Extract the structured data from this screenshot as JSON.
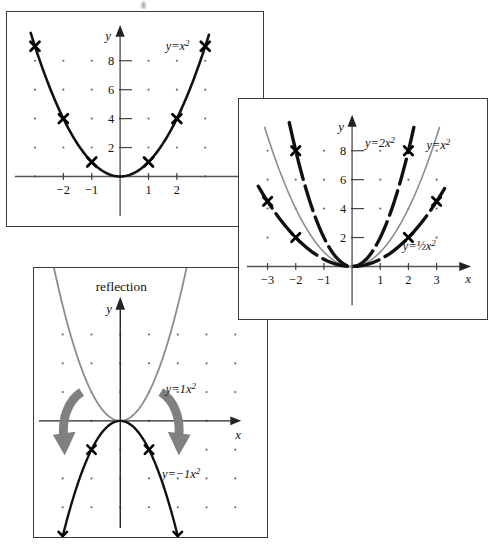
{
  "page": {
    "background_color": "#ffffff",
    "ink_color": "#111111",
    "gray_curve_color": "#8c8c8c",
    "arrow_color": "#808080",
    "grid_dot_color": "#6d6d6d",
    "panel_border_color": "#3a3a3a"
  },
  "panels": [
    {
      "id": "basic",
      "name": "basic-parabola-panel",
      "title": "",
      "axis": {
        "x_label": "x",
        "y_label": "y"
      },
      "x_ticks": [
        {
          "value": -2,
          "label": "−2"
        },
        {
          "value": -1,
          "label": "−1"
        },
        {
          "value": 1,
          "label": "1"
        },
        {
          "value": 2,
          "label": "2"
        }
      ],
      "y_ticks": [
        {
          "value": 2,
          "label": "2"
        },
        {
          "value": 4,
          "label": "4"
        },
        {
          "value": 6,
          "label": "6"
        },
        {
          "value": 8,
          "label": "8"
        }
      ],
      "curves": [
        {
          "name": "curve-y-equals-x-squared",
          "label": "y = x²",
          "label_text": "y=x",
          "label_exponent": "2",
          "coefficient": 1,
          "color": "#111111",
          "style": "solid-black",
          "width": 2.6,
          "marked_points": [
            {
              "x": -3,
              "y": 9
            },
            {
              "x": -2,
              "y": 4
            },
            {
              "x": -1,
              "y": 1
            },
            {
              "x": 1,
              "y": 1
            },
            {
              "x": 2,
              "y": 4
            },
            {
              "x": 3,
              "y": 9
            }
          ]
        }
      ]
    },
    {
      "id": "stretch",
      "name": "stretch-compression-panel",
      "title": "",
      "axis": {
        "x_label": "x",
        "y_label": "y"
      },
      "x_ticks": [
        {
          "value": -3,
          "label": "−3"
        },
        {
          "value": -2,
          "label": "−2"
        },
        {
          "value": -1,
          "label": "−1"
        },
        {
          "value": 1,
          "label": "1"
        },
        {
          "value": 2,
          "label": "2"
        },
        {
          "value": 3,
          "label": "3"
        }
      ],
      "y_ticks": [
        {
          "value": 2,
          "label": "2"
        },
        {
          "value": 4,
          "label": "4"
        },
        {
          "value": 6,
          "label": "6"
        },
        {
          "value": 8,
          "label": "8"
        }
      ],
      "curves": [
        {
          "name": "curve-y-equals-2x-squared",
          "label": "y = 2x²",
          "label_text": "y=2x",
          "label_exponent": "2",
          "coefficient": 2,
          "color": "#111111",
          "style": "dashed-black",
          "width": 3.4,
          "marked_points": [
            {
              "x": -2,
              "y": 8
            },
            {
              "x": 2,
              "y": 8
            }
          ]
        },
        {
          "name": "curve-y-equals-x-squared",
          "label": "y = x²",
          "label_text": "y=x",
          "label_exponent": "2",
          "coefficient": 1,
          "color": "#8c8c8c",
          "style": "solid-gray",
          "width": 1.6,
          "marked_points": []
        },
        {
          "name": "curve-y-equals-half-x-squared",
          "label": "y = ½x²",
          "label_text": "y=½x",
          "label_exponent": "2",
          "coefficient": 0.5,
          "color": "#111111",
          "style": "dashed-black",
          "width": 3.4,
          "marked_points": [
            {
              "x": -3,
              "y": 4.5
            },
            {
              "x": -2,
              "y": 2
            },
            {
              "x": 2,
              "y": 2
            },
            {
              "x": 3,
              "y": 4.5
            }
          ]
        }
      ]
    },
    {
      "id": "reflect",
      "name": "reflection-panel",
      "title": "reflection",
      "axis": {
        "x_label": "x",
        "y_label": "y"
      },
      "x_ticks": [],
      "y_ticks": [],
      "curves": [
        {
          "name": "curve-y-equals-1x-squared",
          "label": "y = 1x²",
          "label_text": "y=1x",
          "label_exponent": "2",
          "coefficient": 1,
          "color": "#8c8c8c",
          "style": "solid-gray",
          "width": 1.8,
          "marked_points": []
        },
        {
          "name": "curve-y-equals-minus-1x-squared",
          "label": "y = −1x²",
          "label_text": "y=−1x",
          "label_exponent": "2",
          "coefficient": -1,
          "color": "#111111",
          "style": "solid-black",
          "width": 2.4,
          "marked_points": [
            {
              "x": -2,
              "y": -4
            },
            {
              "x": -1,
              "y": -1
            },
            {
              "x": 1,
              "y": -1
            },
            {
              "x": 2,
              "y": -4
            }
          ]
        }
      ],
      "annotations": [
        {
          "name": "reflection-arrow-left",
          "kind": "curved-arrow",
          "direction": "down-left",
          "color": "#808080"
        },
        {
          "name": "reflection-arrow-right",
          "kind": "curved-arrow",
          "direction": "down-right",
          "color": "#808080"
        }
      ]
    }
  ],
  "chart_data": {
    "type": "line",
    "xlabel": "x",
    "ylabel": "y",
    "charts": [
      {
        "panel": "basic",
        "title": "",
        "xlim": [
          -3.4,
          3.4
        ],
        "ylim": [
          -1.5,
          9.8
        ],
        "xticks": [
          -2,
          -1,
          1,
          2
        ],
        "yticks": [
          2,
          4,
          6,
          8
        ],
        "grid": "dots",
        "series": [
          {
            "name": "y=x²",
            "equation": "y = x^2",
            "coefficient": 1,
            "color": "#111111",
            "x": [
              -3,
              -2,
              -1,
              0,
              1,
              2,
              3
            ],
            "values": [
              9,
              4,
              1,
              0,
              1,
              4,
              9
            ],
            "markers": [
              {
                "x": -3,
                "y": 9
              },
              {
                "x": -2,
                "y": 4
              },
              {
                "x": -1,
                "y": 1
              },
              {
                "x": 1,
                "y": 1
              },
              {
                "x": 2,
                "y": 4
              },
              {
                "x": 3,
                "y": 9
              }
            ]
          }
        ]
      },
      {
        "panel": "stretch",
        "title": "",
        "xlim": [
          -3.7,
          3.7
        ],
        "ylim": [
          -1.5,
          9.6
        ],
        "xticks": [
          -3,
          -2,
          -1,
          1,
          2,
          3
        ],
        "yticks": [
          2,
          4,
          6,
          8
        ],
        "grid": "dots",
        "series": [
          {
            "name": "y=2x²",
            "equation": "y = 2x^2",
            "coefficient": 2,
            "color": "#111111",
            "x": [
              -2.2,
              -2,
              -1,
              0,
              1,
              2,
              2.2
            ],
            "values": [
              9.68,
              8,
              2,
              0,
              2,
              8,
              9.68
            ],
            "markers": [
              {
                "x": -2,
                "y": 8
              },
              {
                "x": 2,
                "y": 8
              }
            ]
          },
          {
            "name": "y=x²",
            "equation": "y = x^2",
            "coefficient": 1,
            "color": "#8c8c8c",
            "x": [
              -3,
              -2,
              -1,
              0,
              1,
              2,
              3
            ],
            "values": [
              9,
              4,
              1,
              0,
              1,
              4,
              9
            ],
            "markers": []
          },
          {
            "name": "y=½x²",
            "equation": "y = 0.5x^2",
            "coefficient": 0.5,
            "color": "#111111",
            "x": [
              -3.3,
              -3,
              -2,
              -1,
              0,
              1,
              2,
              3,
              3.3
            ],
            "values": [
              5.45,
              4.5,
              2,
              0.5,
              0,
              0.5,
              2,
              4.5,
              5.45
            ],
            "markers": [
              {
                "x": -3,
                "y": 4.5
              },
              {
                "x": -2,
                "y": 2
              },
              {
                "x": 2,
                "y": 2
              },
              {
                "x": 3,
                "y": 4.5
              }
            ]
          }
        ]
      },
      {
        "panel": "reflect",
        "title": "reflection",
        "xlim": [
          -2.9,
          2.9
        ],
        "ylim": [
          -5.6,
          5.4
        ],
        "xticks": [],
        "yticks": [],
        "grid": "dots",
        "series": [
          {
            "name": "y=1x²",
            "equation": "y = 1x^2",
            "coefficient": 1,
            "color": "#8c8c8c",
            "x": [
              -2.3,
              -2,
              -1,
              0,
              1,
              2,
              2.3
            ],
            "values": [
              5.29,
              4,
              1,
              0,
              1,
              4,
              5.29
            ],
            "markers": []
          },
          {
            "name": "y=−1x²",
            "equation": "y = -1x^2",
            "coefficient": -1,
            "color": "#111111",
            "x": [
              -2.4,
              -2,
              -1,
              0,
              1,
              2,
              2.4
            ],
            "values": [
              -5.76,
              -4,
              -1,
              0,
              -1,
              -4,
              -5.76
            ],
            "markers": [
              {
                "x": -2,
                "y": -4
              },
              {
                "x": -1,
                "y": -1
              },
              {
                "x": 1,
                "y": -1
              },
              {
                "x": 2,
                "y": -4
              }
            ]
          }
        ]
      }
    ]
  }
}
